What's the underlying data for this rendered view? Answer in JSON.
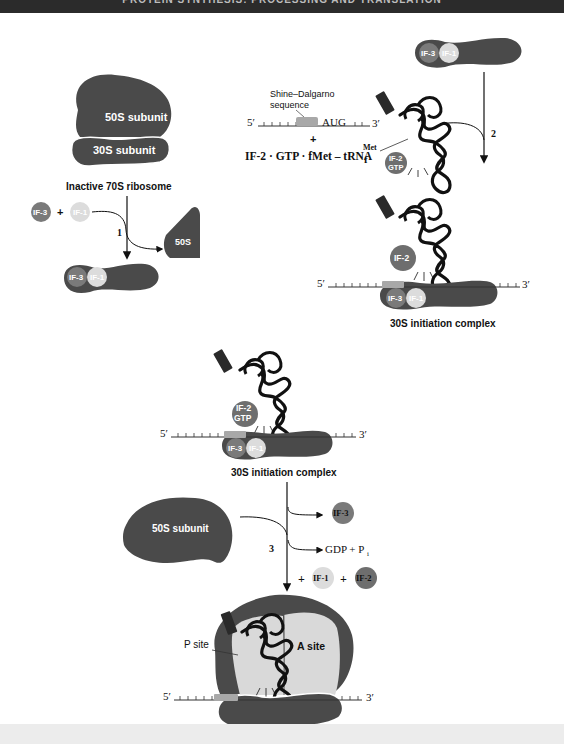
{
  "header": {
    "title": "PROTEIN SYNTHESIS: PROCESSING AND TRANSLATION"
  },
  "colors": {
    "ribosome": "#4a4a4a",
    "if3": "#7a7a7a",
    "if1": "#dcdcdc",
    "if2": "#6e6e6e",
    "site_fill": "#d9d9d9",
    "sd_box": "#a8a8a8",
    "trna": "#111111"
  },
  "panel_a": {
    "subunit_50s": "50S subunit",
    "subunit_30s": "30S subunit",
    "caption": "Inactive 70S ribosome",
    "if3": "IF-3",
    "plus": "+",
    "if1": "IF-1",
    "step": "1",
    "product_50s": "50S",
    "complex_if3": "IF-3",
    "complex_if1": "IF-1"
  },
  "panel_b": {
    "sd_label_1": "Shine–Dalgarno",
    "sd_label_2": "sequence",
    "five_prime": "5′",
    "aug": "AUG",
    "three_prime": "3′",
    "plus": "+",
    "factor_formula": "IF-2 · GTP · fMet – tRNA",
    "trna_sup": "Met",
    "trna_sub": "f",
    "if2_gtp_1": "IF-2",
    "if2_gtp_2": "GTP",
    "fmet_tag": "fMet",
    "ribo_if3": "IF-3",
    "ribo_if1": "IF-1",
    "step": "2"
  },
  "panel_c": {
    "five_prime": "5′",
    "three_prime": "3′",
    "if2": "IF-2",
    "if3": "IF-3",
    "if1": "IF-1",
    "fmet_tag": "fMet",
    "caption": "30S initiation complex"
  },
  "panel_d": {
    "five_prime": "5′",
    "three_prime": "3′",
    "if2_1": "IF-2",
    "if2_2": "GTP",
    "if3": "IF-3",
    "if1": "IF-1",
    "fmet_tag": "fMet",
    "caption": "30S initiation complex"
  },
  "panel_e": {
    "subunit_50s": "50S subunit",
    "step": "3",
    "release_if3": "IF-3",
    "gdp": "GDP + P",
    "gdp_sub": "i",
    "plus1": "+",
    "release_if1": "IF-1",
    "plus2": "+",
    "release_if2": "IF-2"
  },
  "panel_f": {
    "p_site": "P site",
    "a_site": "A site",
    "five_prime": "5′",
    "three_prime": "3′",
    "fmet_tag": "fMet"
  }
}
